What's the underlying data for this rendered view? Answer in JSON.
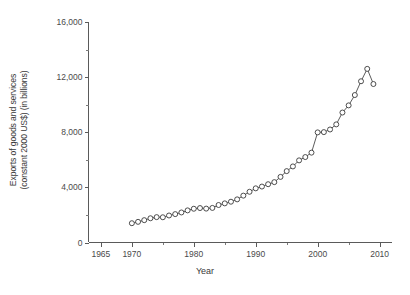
{
  "chart_data": {
    "type": "line",
    "title": "",
    "xlabel": "Year",
    "ylabel_line1": "Exports of goods and services",
    "ylabel_line2": "(constant 2000 US$) (in billions)",
    "xlim": [
      1963,
      2012
    ],
    "ylim": [
      0,
      16000
    ],
    "grid": false,
    "legend": "none",
    "marker": "open-circle",
    "line_color": "#3a3a3a",
    "xticks": [
      1965,
      1970,
      1980,
      1990,
      2000,
      2010
    ],
    "xtick_labels": [
      "1965",
      "1970",
      "1980",
      "1990",
      "2000",
      "2010"
    ],
    "xticks_minor": [
      1975,
      1985,
      1995,
      2005
    ],
    "yticks": [
      0,
      4000,
      8000,
      12000,
      16000
    ],
    "ytick_labels": [
      "0",
      "4,000",
      "8,000",
      "12,000",
      "16,000"
    ],
    "yticks_minor": [
      2000,
      6000,
      10000,
      14000
    ],
    "x": [
      1970,
      1971,
      1972,
      1973,
      1974,
      1975,
      1976,
      1977,
      1978,
      1979,
      1980,
      1981,
      1982,
      1983,
      1984,
      1985,
      1986,
      1987,
      1988,
      1989,
      1990,
      1991,
      1992,
      1993,
      1994,
      1995,
      1996,
      1997,
      1998,
      1999,
      2000,
      2001,
      2002,
      2003,
      2004,
      2005,
      2006,
      2007,
      2008,
      2009
    ],
    "values": [
      1400,
      1500,
      1620,
      1760,
      1840,
      1830,
      1960,
      2060,
      2180,
      2330,
      2450,
      2500,
      2460,
      2510,
      2720,
      2840,
      2960,
      3130,
      3400,
      3680,
      3930,
      4060,
      4230,
      4380,
      4760,
      5180,
      5520,
      5960,
      6200,
      6520,
      7990,
      8010,
      8200,
      8570,
      9430,
      9950,
      10700,
      11700,
      12600,
      11500
    ],
    "value_unit": "billions of constant 2000 US$",
    "peak_year": 2008,
    "peak_value": 12600,
    "last_year": 2009,
    "last_value": 11500
  }
}
